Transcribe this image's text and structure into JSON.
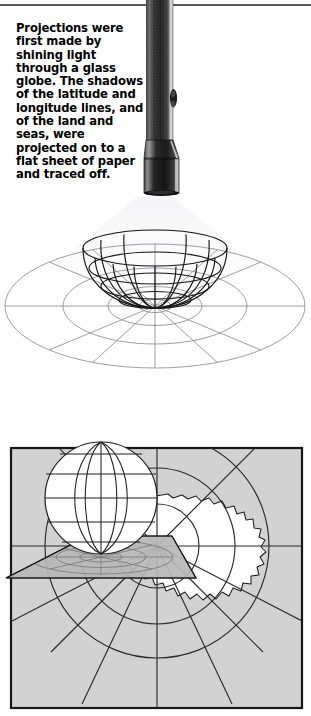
{
  "page": {
    "background_color": "#ffffff",
    "width": 311,
    "height": 716
  },
  "rule": {
    "color": "#555a5e"
  },
  "caption": {
    "text": "Projections were first made by shining light through a glass globe. The shadows of the latitude and longitude lines, and of the land and seas, were projected on to a flat sheet of paper and traced off.",
    "color": "#000000"
  },
  "flashlight": {
    "name": "flashlight",
    "barrel_color": "#2b2b2b",
    "barrel_texture_color": "#8d8d8d",
    "bezel_color": "#1c1c1c",
    "highlight_color": "#b9b9b9"
  },
  "figure_bowl": {
    "name": "wireframe-hemisphere-with-projected-shadow",
    "wire_color": "#111111",
    "shadow_grid_color": "#8b8b92",
    "light_cone_color": "#efeff1",
    "meridian_count": 12,
    "parallel_count": 4,
    "shadow_rings": 4,
    "shadow_spokes": 12
  },
  "figure_map": {
    "name": "azimuthal-polar-projection-antarctica",
    "frame_color": "#1a1a1a",
    "ocean_fill": "#d2d2d2",
    "land_fill": "#ffffff",
    "graticule_color": "#2a2a2a",
    "globe_fill": "#ffffff",
    "globe_line_color": "#1f1f1f",
    "paper_fill": "#b8b8b8",
    "paper_edge_color": "#1a1a1a",
    "paper_grid_color": "#7a7a7a",
    "landmass_label": "Antarctica",
    "globe_meridians": 6,
    "globe_parallels": 5,
    "map_rings": 3,
    "map_spokes": 8
  }
}
